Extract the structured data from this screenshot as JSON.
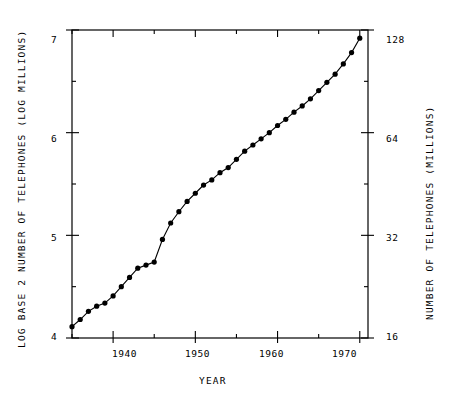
{
  "chart_data": {
    "type": "line",
    "title": "",
    "xlabel": "YEAR",
    "ylabel": "LOG BASE 2 NUMBER OF TELEPHONES (LOG MILLIONS)",
    "ylabel_right": "NUMBER OF TELEPHONES (MILLIONS)",
    "xlim": [
      1935,
      1971
    ],
    "ylim": [
      4,
      7
    ],
    "ylim_right": [
      16,
      128
    ],
    "grid": false,
    "legend": null,
    "marker": "filled-circle",
    "x_major_ticks": [
      1940,
      1950,
      1960,
      1970
    ],
    "x_major_tick_labels": [
      "1940",
      "1950",
      "1960",
      "1970"
    ],
    "x_minor_ticks": [
      1935,
      1945,
      1955,
      1965
    ],
    "y_major_ticks": [
      4,
      5,
      6,
      7
    ],
    "y_major_tick_labels": [
      "4",
      "5",
      "6",
      "7"
    ],
    "y_minor_ticks": [
      4.5,
      5.5,
      6.5
    ],
    "y_right_major_ticks": [
      16,
      32,
      64,
      128
    ],
    "y_right_major_tick_labels": [
      "16",
      "32",
      "64",
      "128"
    ],
    "x": [
      1935,
      1936,
      1937,
      1938,
      1939,
      1940,
      1941,
      1942,
      1943,
      1944,
      1945,
      1946,
      1947,
      1948,
      1949,
      1950,
      1951,
      1952,
      1953,
      1954,
      1955,
      1956,
      1957,
      1958,
      1959,
      1960,
      1961,
      1962,
      1963,
      1964,
      1965,
      1966,
      1967,
      1968,
      1969,
      1970
    ],
    "values": [
      4.11,
      4.18,
      4.26,
      4.31,
      4.34,
      4.41,
      4.5,
      4.59,
      4.68,
      4.71,
      4.74,
      4.96,
      5.12,
      5.23,
      5.33,
      5.41,
      5.49,
      5.54,
      5.61,
      5.66,
      5.74,
      5.82,
      5.88,
      5.94,
      6.0,
      6.07,
      6.13,
      6.2,
      6.26,
      6.33,
      6.41,
      6.49,
      6.57,
      6.67,
      6.78,
      6.92
    ],
    "values_millions": [
      17.3,
      18.1,
      19.2,
      19.8,
      20.2,
      21.3,
      22.6,
      24.1,
      25.6,
      26.2,
      26.7,
      31.1,
      34.8,
      37.5,
      40.2,
      42.5,
      44.9,
      46.5,
      48.8,
      50.5,
      53.5,
      56.5,
      58.9,
      61.4,
      64.0,
      67.2,
      70.0,
      73.5,
      76.6,
      80.4,
      85.0,
      89.9,
      95.0,
      101.8,
      109.9,
      121.0
    ]
  }
}
